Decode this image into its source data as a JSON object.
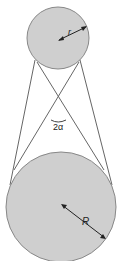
{
  "diagram": {
    "colors": {
      "circle_fill": "#cfcfcf",
      "circle_stroke": "#888888",
      "line_stroke": "#666666",
      "text": "#222222",
      "background": "#ffffff"
    },
    "small_circle": {
      "label": "r",
      "cx": 58,
      "cy": 38,
      "radius": 31
    },
    "large_circle": {
      "label": "R",
      "cx": 61,
      "cy": 207,
      "radius": 55
    },
    "crossing_point": {
      "x": 58,
      "y": 110
    },
    "angle": {
      "label": "2α"
    }
  }
}
